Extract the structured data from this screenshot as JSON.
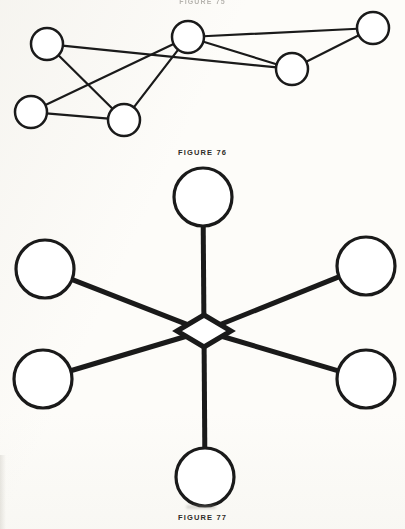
{
  "page": {
    "width": 405,
    "height": 529,
    "background_color": "#fdfcf9",
    "ink_color": "#1a1a1a",
    "top_partial_caption": "FIGURE 75"
  },
  "figure_76": {
    "caption": "FIGURE 76",
    "description": "Irregular network graph of six open circles joined by straight line segments",
    "node_radius": 16,
    "stroke_width": 2.2,
    "nodes": [
      {
        "id": "n1",
        "label": "upper-left-node",
        "cx": 47,
        "cy": 44
      },
      {
        "id": "n2",
        "label": "upper-center-node",
        "cx": 188,
        "cy": 37
      },
      {
        "id": "n3",
        "label": "upper-right-node",
        "cx": 373,
        "cy": 28
      },
      {
        "id": "n4",
        "label": "mid-right-node",
        "cx": 292,
        "cy": 69
      },
      {
        "id": "n5",
        "label": "lower-left-node",
        "cx": 31,
        "cy": 112
      },
      {
        "id": "n6",
        "label": "lower-center-node",
        "cx": 124,
        "cy": 120
      }
    ],
    "edges": [
      {
        "from": "n1",
        "to": "n4"
      },
      {
        "from": "n1",
        "to": "n6"
      },
      {
        "from": "n2",
        "to": "n3"
      },
      {
        "from": "n2",
        "to": "n4"
      },
      {
        "from": "n2",
        "to": "n5"
      },
      {
        "from": "n2",
        "to": "n6"
      },
      {
        "from": "n3",
        "to": "n4"
      },
      {
        "from": "n5",
        "to": "n6"
      }
    ]
  },
  "figure_77": {
    "caption": "FIGURE 77",
    "description": "Star topology: six large open circles connected by thick spokes to a central diamond hub",
    "node_radius": 29,
    "stroke_width": 3.2,
    "spoke_width": 5.0,
    "hub": {
      "label": "center-diamond-hub",
      "cx": 204,
      "cy": 331,
      "half_width": 27,
      "half_height": 16
    },
    "nodes": [
      {
        "id": "s1",
        "label": "top-node",
        "cx": 203,
        "cy": 197
      },
      {
        "id": "s2",
        "label": "upper-left-node",
        "cx": 45,
        "cy": 269
      },
      {
        "id": "s3",
        "label": "upper-right-node",
        "cx": 366,
        "cy": 266
      },
      {
        "id": "s4",
        "label": "lower-left-node",
        "cx": 43,
        "cy": 379
      },
      {
        "id": "s5",
        "label": "lower-right-node",
        "cx": 366,
        "cy": 379
      },
      {
        "id": "s6",
        "label": "bottom-node",
        "cx": 205,
        "cy": 477
      }
    ],
    "edges": [
      {
        "from": "hub",
        "to": "s1"
      },
      {
        "from": "hub",
        "to": "s2"
      },
      {
        "from": "hub",
        "to": "s3"
      },
      {
        "from": "hub",
        "to": "s4"
      },
      {
        "from": "hub",
        "to": "s5"
      },
      {
        "from": "hub",
        "to": "s6"
      }
    ]
  }
}
